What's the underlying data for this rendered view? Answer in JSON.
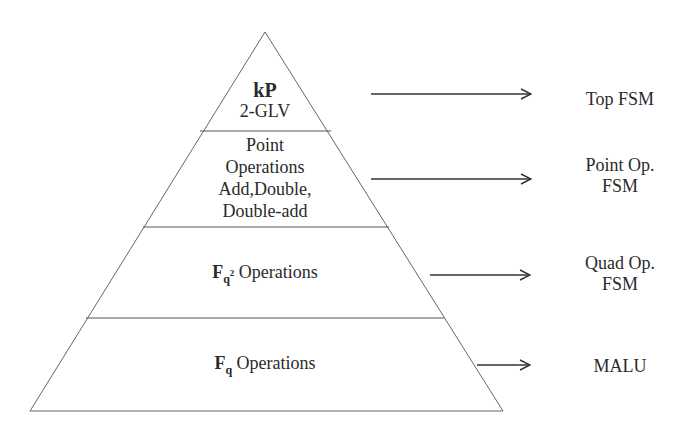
{
  "diagram": {
    "type": "pyramid-hierarchy",
    "colors": {
      "stroke": "#555555",
      "text": "#2a2a2a",
      "background": "#ffffff"
    },
    "layers": [
      {
        "id": "top",
        "title": "kP",
        "lines": [
          "2-GLV"
        ],
        "maps_to": [
          "Top FSM"
        ]
      },
      {
        "id": "point",
        "title": "",
        "lines": [
          "Point",
          "Operations",
          "Add,Double,",
          "Double-add"
        ],
        "maps_to": [
          "Point Op.",
          "FSM"
        ]
      },
      {
        "id": "quad",
        "title_symbol": "F",
        "title_subscript": "q",
        "title_superscript": "2",
        "title_rest": " Operations",
        "maps_to": [
          "Quad Op.",
          "FSM"
        ]
      },
      {
        "id": "base",
        "title_symbol": "F",
        "title_subscript": "q",
        "title_rest": " Operations",
        "maps_to": [
          "MALU"
        ]
      }
    ]
  }
}
